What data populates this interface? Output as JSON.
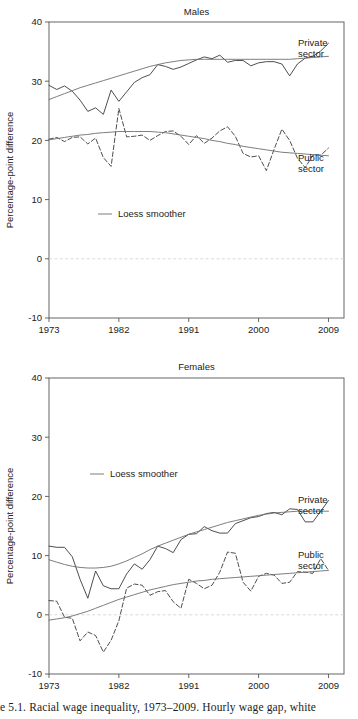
{
  "figure": {
    "caption": "e 5.1.  Racial wage inequality, 1973–2009. Hourly wage gap, white"
  },
  "axis": {
    "ylabel": "Percentage-point difference",
    "yticks": [
      40,
      30,
      20,
      10,
      0,
      -10
    ],
    "xticks": [
      1973,
      1982,
      1991,
      2000,
      2009
    ],
    "ylim": [
      -10,
      40
    ],
    "xlim": [
      1973,
      2011
    ],
    "zero_line_color": "#d9d9d9",
    "axis_color": "#555555",
    "line_color": "#3a3a3a",
    "smoother_color": "#6e6e6e"
  },
  "legend": {
    "smoother_label": "Loess smoother"
  },
  "labels": {
    "private_line1": "Private",
    "private_line2": "sector",
    "public_line1": "Public",
    "public_line2": "sector"
  },
  "chart_data": [
    {
      "type": "line",
      "title": "Males",
      "xlabel": "",
      "ylabel": "Percentage-point difference",
      "ylim": [
        -10,
        40
      ],
      "xlim": [
        1973,
        2011
      ],
      "grid": false,
      "legend": "inside-left",
      "annotations": [
        "Private sector",
        "Public sector",
        "Loess smoother"
      ],
      "x": [
        1973,
        1974,
        1975,
        1976,
        1977,
        1978,
        1979,
        1980,
        1981,
        1982,
        1983,
        1984,
        1985,
        1986,
        1987,
        1988,
        1989,
        1990,
        1991,
        1992,
        1993,
        1994,
        1995,
        1996,
        1997,
        1998,
        1999,
        2000,
        2001,
        2002,
        2003,
        2004,
        2005,
        2006,
        2007,
        2008,
        2009
      ],
      "series": [
        {
          "name": "Private sector",
          "style": "solid",
          "values": [
            29.3,
            28.6,
            29.2,
            28.3,
            26.8,
            24.9,
            25.5,
            24.4,
            28.5,
            26.6,
            28.2,
            29.8,
            30.6,
            31.1,
            32.8,
            32.5,
            32.0,
            32.4,
            33.0,
            33.6,
            34.1,
            33.8,
            34.4,
            33.2,
            33.5,
            33.5,
            32.6,
            33.1,
            33.3,
            33.3,
            32.9,
            30.9,
            32.9,
            33.9,
            34.2,
            35.1,
            36.4
          ]
        },
        {
          "name": "Public sector",
          "style": "dashed",
          "values": [
            20.2,
            20.5,
            19.8,
            20.5,
            20.6,
            19.4,
            20.4,
            17.1,
            15.6,
            25.4,
            20.6,
            20.7,
            20.9,
            20.0,
            20.8,
            21.5,
            21.6,
            20.7,
            19.3,
            20.8,
            19.5,
            20.4,
            21.6,
            22.3,
            20.7,
            17.8,
            17.2,
            17.4,
            14.9,
            18.5,
            21.9,
            20.0,
            17.0,
            15.4,
            17.5,
            17.5,
            18.7
          ]
        },
        {
          "name": "Private sector loess",
          "style": "smoother",
          "values": [
            26.9,
            27.4,
            27.9,
            28.4,
            28.9,
            29.3,
            29.7,
            30.1,
            30.5,
            30.9,
            31.3,
            31.7,
            32.1,
            32.5,
            32.8,
            33.1,
            33.3,
            33.5,
            33.6,
            33.7,
            33.7,
            33.7,
            33.7,
            33.7,
            33.7,
            33.7,
            33.7,
            33.7,
            33.7,
            33.7,
            33.7,
            33.7,
            33.8,
            33.9,
            34.0,
            34.1,
            34.2
          ]
        },
        {
          "name": "Public sector loess",
          "style": "smoother",
          "values": [
            20.1,
            20.3,
            20.5,
            20.7,
            20.9,
            21.0,
            21.2,
            21.3,
            21.4,
            21.5,
            21.5,
            21.5,
            21.5,
            21.5,
            21.4,
            21.3,
            21.1,
            20.9,
            20.7,
            20.5,
            20.3,
            20.0,
            19.8,
            19.5,
            19.3,
            19.0,
            18.8,
            18.6,
            18.4,
            18.2,
            18.0,
            17.9,
            17.8,
            17.7,
            17.6,
            17.5,
            17.4
          ]
        }
      ]
    },
    {
      "type": "line",
      "title": "Females",
      "xlabel": "",
      "ylabel": "Percentage-point difference",
      "ylim": [
        -10,
        40
      ],
      "xlim": [
        1973,
        2011
      ],
      "grid": false,
      "legend": "inside-left",
      "annotations": [
        "Private sector",
        "Public sector",
        "Loess smoother"
      ],
      "x": [
        1973,
        1974,
        1975,
        1976,
        1977,
        1978,
        1979,
        1980,
        1981,
        1982,
        1983,
        1984,
        1985,
        1986,
        1987,
        1988,
        1989,
        1990,
        1991,
        1992,
        1993,
        1994,
        1995,
        1996,
        1997,
        1998,
        1999,
        2000,
        2001,
        2002,
        2003,
        2004,
        2005,
        2006,
        2007,
        2008,
        2009
      ],
      "series": [
        {
          "name": "Private sector",
          "style": "solid",
          "values": [
            11.6,
            11.4,
            11.4,
            9.8,
            6.0,
            2.8,
            7.4,
            4.9,
            4.4,
            4.4,
            6.9,
            8.6,
            7.7,
            9.3,
            11.6,
            11.2,
            10.5,
            12.7,
            13.6,
            13.7,
            14.9,
            14.2,
            13.8,
            13.8,
            15.4,
            15.9,
            16.4,
            16.6,
            17.1,
            17.3,
            16.9,
            17.9,
            17.8,
            15.7,
            15.7,
            17.5,
            19.3
          ]
        },
        {
          "name": "Public sector",
          "style": "dashed",
          "values": [
            2.4,
            2.3,
            -0.4,
            -0.6,
            -4.4,
            -2.9,
            -3.5,
            -6.3,
            -4.3,
            -1.0,
            4.5,
            5.2,
            5.0,
            3.3,
            3.9,
            4.1,
            2.2,
            1.1,
            6.0,
            5.3,
            4.4,
            5.0,
            7.2,
            10.6,
            10.4,
            5.5,
            4.0,
            6.5,
            7.0,
            6.7,
            5.3,
            5.5,
            7.3,
            7.2,
            7.0,
            9.5,
            7.5
          ]
        },
        {
          "name": "Private sector loess",
          "style": "smoother",
          "values": [
            9.3,
            8.9,
            8.5,
            8.2,
            8.0,
            7.9,
            7.9,
            8.0,
            8.2,
            8.6,
            9.1,
            9.7,
            10.3,
            11.0,
            11.6,
            12.1,
            12.6,
            13.1,
            13.6,
            14.0,
            14.4,
            14.8,
            15.2,
            15.6,
            15.9,
            16.2,
            16.5,
            16.8,
            17.0,
            17.2,
            17.3,
            17.4,
            17.5,
            17.5,
            17.5,
            17.5,
            17.5
          ]
        },
        {
          "name": "Public sector loess",
          "style": "smoother",
          "values": [
            -0.9,
            -0.7,
            -0.5,
            -0.2,
            0.2,
            0.6,
            1.1,
            1.6,
            2.1,
            2.6,
            3.0,
            3.4,
            3.8,
            4.2,
            4.5,
            4.8,
            5.1,
            5.3,
            5.5,
            5.7,
            5.8,
            6.0,
            6.1,
            6.2,
            6.3,
            6.4,
            6.5,
            6.6,
            6.7,
            6.8,
            6.9,
            7.0,
            7.1,
            7.2,
            7.3,
            7.4,
            7.5
          ]
        }
      ]
    }
  ]
}
